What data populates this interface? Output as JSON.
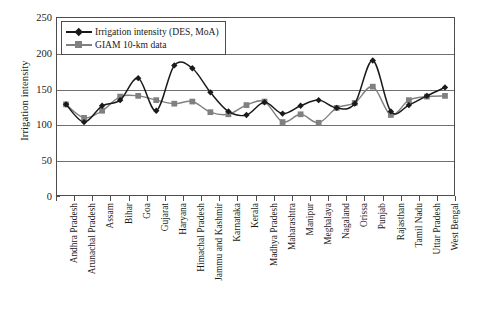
{
  "chart_data": {
    "type": "line",
    "title": "",
    "xlabel": "",
    "ylabel": "Irrigation intensity",
    "ylim": [
      0,
      250
    ],
    "yticks": [
      0,
      50,
      100,
      150,
      200,
      250
    ],
    "grid": true,
    "legend_position": "top-left",
    "categories": [
      "Andhra Pradesh",
      "Arunachal Pradesh",
      "Assam",
      "Bihar",
      "Goa",
      "Gujarat",
      "Haryana",
      "Himachal Pradesh",
      "Jammu and Kashmir",
      "Karnataka",
      "Kerala",
      "Madhya Pradesh",
      "Maharashtra",
      "Manipur",
      "Meghalaya",
      "Nagaland",
      "Orissa",
      "Punjab",
      "Rajasthan",
      "Tamil Nadu",
      "Uttar Pradesh",
      "West Bengal"
    ],
    "series": [
      {
        "name": "Irrigation intensity (DES, MoA)",
        "color": "#1a1a1a",
        "marker": "diamond",
        "values": [
          128,
          103,
          126,
          134,
          165,
          119,
          183,
          179,
          145,
          118,
          113,
          131,
          115,
          126,
          134,
          123,
          129,
          190,
          118,
          127,
          140,
          152
        ]
      },
      {
        "name": "GIAM 10-km data",
        "color": "#808080",
        "marker": "square",
        "values": [
          128,
          109,
          119,
          139,
          140,
          134,
          129,
          132,
          117,
          114,
          127,
          132,
          103,
          114,
          102,
          123,
          130,
          153,
          113,
          134,
          139,
          140
        ]
      }
    ]
  },
  "legend": {
    "items": [
      {
        "label": "Irrigation intensity (DES, MoA)"
      },
      {
        "label": "GIAM 10-km data"
      }
    ]
  },
  "axes": {
    "y_title": "Irrigation intensity",
    "y_tick_labels": [
      "250",
      "200",
      "150",
      "100",
      "50",
      "0"
    ]
  },
  "colors": {
    "series_1": "#1a1a1a",
    "series_2": "#808080",
    "grid": "#707070",
    "frame": "#4d4d4d",
    "background": "#ffffff"
  }
}
